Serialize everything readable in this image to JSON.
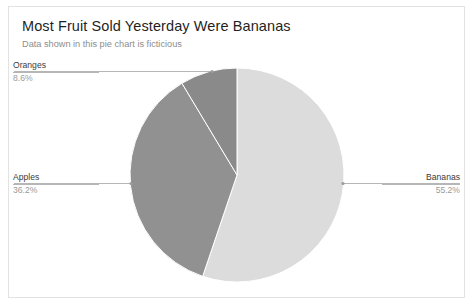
{
  "card": {
    "border_color": "#e2e2e2",
    "background": "#ffffff"
  },
  "header": {
    "title": "Most Fruit Sold Yesterday Were Bananas",
    "subtitle": "Data shown in this pie chart is ficticious"
  },
  "callouts": {
    "oranges": {
      "name": "Oranges",
      "pct": "8.6%"
    },
    "apples": {
      "name": "Apples",
      "pct": "36.2%"
    },
    "bananas": {
      "name": "Bananas",
      "pct": "55.2%"
    }
  },
  "chart_data": {
    "type": "pie",
    "title": "Most Fruit Sold Yesterday Were Bananas",
    "subtitle": "Data shown in this pie chart is ficticious",
    "categories": [
      "Bananas",
      "Apples",
      "Oranges"
    ],
    "values": [
      55.2,
      36.2,
      8.6
    ],
    "value_labels": [
      "55.2%",
      "36.2%",
      "8.6%"
    ],
    "colors": [
      "#dcdcdc",
      "#919191",
      "#8a8a8a"
    ],
    "unit": "percent",
    "start_angle_deg": 0,
    "direction": "clockwise",
    "legend": "none",
    "labels_position": "outside-with-leader-lines",
    "leader_line_color": "#b6b6b6",
    "grid": false,
    "center": {
      "x": 237,
      "y": 175
    },
    "radius": 107,
    "slices": [
      {
        "label": "Bananas",
        "value": 55.2,
        "display": "55.2%",
        "color": "#dcdcdc",
        "start_deg": 0,
        "end_deg": 198.72
      },
      {
        "label": "Apples",
        "value": 36.2,
        "display": "36.2%",
        "color": "#919191",
        "start_deg": 198.72,
        "end_deg": 329.04
      },
      {
        "label": "Oranges",
        "value": 8.6,
        "display": "8.6%",
        "color": "#8a8a8a",
        "start_deg": 329.04,
        "end_deg": 360
      }
    ]
  }
}
